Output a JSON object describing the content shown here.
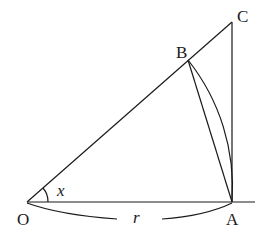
{
  "diagram": {
    "type": "geometry",
    "points": {
      "O": {
        "label": "O",
        "x": 27,
        "y": 202
      },
      "A": {
        "label": "A",
        "x": 232,
        "y": 202
      },
      "B": {
        "label": "B",
        "x": 188,
        "y": 60
      },
      "C": {
        "label": "C",
        "x": 232,
        "y": 22
      }
    },
    "angle_label": "x",
    "radius_label": "r",
    "segments": [
      "OA",
      "OC",
      "AC",
      "AB"
    ],
    "arcs": [
      "arc BA (center O)",
      "angle arc at O",
      "brace under OA"
    ]
  }
}
